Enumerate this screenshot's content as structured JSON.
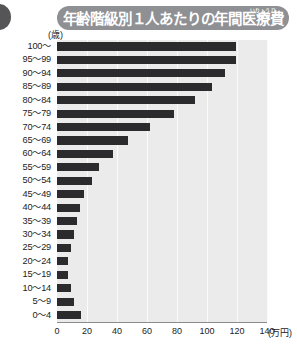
{
  "figure": {
    "title": "年齢階級別１人あたりの年間医療費",
    "title_ruby": "いりょうひ",
    "y_unit_label": "(歳)",
    "x_unit_label": "(万円)",
    "bar_color": "#2b2b2d",
    "plot_background": "#ebebeb",
    "title_banner_color": "#8f9094"
  },
  "chart_data": {
    "type": "bar",
    "orientation": "horizontal",
    "title": "年齢階級別１人あたりの年間医療費",
    "xlabel": "(万円)",
    "ylabel": "(歳)",
    "xlim": [
      0,
      140
    ],
    "xticks": [
      0,
      20,
      40,
      60,
      80,
      100,
      120,
      140
    ],
    "xticklabels": [
      "0",
      "20",
      "40",
      "60",
      "80",
      "100",
      "120",
      "140"
    ],
    "grid": true,
    "legend": false,
    "categories": [
      "100～",
      "95～99",
      "90～94",
      "85～89",
      "80～84",
      "75～79",
      "70～74",
      "65～69",
      "60～64",
      "55～59",
      "50～54",
      "45～49",
      "40～44",
      "35～39",
      "30～34",
      "25～29",
      "20～24",
      "15～19",
      "10～14",
      "5～9",
      "0～4"
    ],
    "values": [
      119,
      119,
      112,
      103,
      92,
      78,
      62,
      47,
      37,
      28,
      23,
      18,
      15,
      13,
      11,
      9,
      7,
      7,
      9,
      11,
      16
    ]
  }
}
